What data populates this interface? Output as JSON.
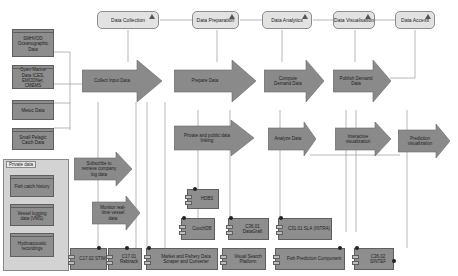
{
  "stages": [
    {
      "id": "data-collection",
      "label": "Data Collection"
    },
    {
      "id": "data-preparation",
      "label": "Data Preparation"
    },
    {
      "id": "data-analytics",
      "label": "Data Analytics"
    },
    {
      "id": "data-visualisation",
      "label": "Data Visualisation"
    },
    {
      "id": "data-access",
      "label": "Data Access"
    }
  ],
  "sources": [
    {
      "id": "smhi",
      "label": "SMHI/OD Oceanographic Data"
    },
    {
      "id": "open-marine",
      "label": "Open Marine Data ICES, EMODNet, CMEMS"
    },
    {
      "id": "metoc",
      "label": "Metoc Data"
    },
    {
      "id": "small-pelagic",
      "label": "Small Pelagic Catch Data"
    }
  ],
  "private_group": {
    "label": "Private data",
    "items": [
      {
        "id": "fish-catch",
        "label": "Fish catch history"
      },
      {
        "id": "vessel-logging",
        "label": "Vessel logging data (VMS)"
      },
      {
        "id": "hydroacoustic",
        "label": "Hydroacoustic recordings"
      }
    ]
  },
  "processes": [
    {
      "id": "collect-input",
      "label": "Collect Input Data"
    },
    {
      "id": "prepare",
      "label": "Prepare Data"
    },
    {
      "id": "compute-demand",
      "label": "Compute Demand Data"
    },
    {
      "id": "publish-demand",
      "label": "Publish Demand Data"
    },
    {
      "id": "private-public-linking",
      "label": "Private and public data linking"
    },
    {
      "id": "analyze",
      "label": "Analyze Data"
    },
    {
      "id": "interactive-vis",
      "label": "Interactive visualization"
    },
    {
      "id": "prediction-vis",
      "label": "Prediction visualization"
    },
    {
      "id": "subscribe",
      "label": "Subscribe to retrieve company log data"
    },
    {
      "id": "monitor",
      "label": "Monitor real-time vessel data"
    }
  ],
  "components": [
    {
      "id": "c17-02",
      "label": "C17.02 STIM"
    },
    {
      "id": "c17-01",
      "label": "C17.01 Rabtrack"
    },
    {
      "id": "market-scraper",
      "label": "Market and Fishery Data Scraper and Converter"
    },
    {
      "id": "visual-search",
      "label": "Visual Search Platform"
    },
    {
      "id": "fish-prediction",
      "label": "Fish Prediction Component"
    },
    {
      "id": "c36-02",
      "label": "C36.02 SINTEF"
    },
    {
      "id": "hdbs",
      "label": "HDBS"
    },
    {
      "id": "couchdb",
      "label": "CouchDB"
    },
    {
      "id": "c36-01",
      "label": "C36.01 DataGraft"
    },
    {
      "id": "c31-01",
      "label": "C31.01 SLA (INTRA)"
    }
  ],
  "colors": {
    "process": "#8a8a8a",
    "stage": "#e2e2e2",
    "group": "#d3d3d3",
    "line": "#8c8c8c"
  }
}
